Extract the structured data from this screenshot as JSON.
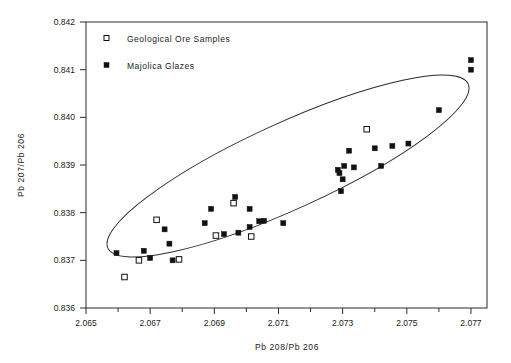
{
  "chart_data": {
    "type": "scatter",
    "title": "",
    "xlabel": "Pb 208/Pb 206",
    "ylabel": "Pb 207/Pb 206",
    "xlim": [
      2.065,
      2.0775
    ],
    "ylim": [
      0.836,
      0.842
    ],
    "grid": false,
    "legend_position": "top-left-inside",
    "x_ticks_major": [
      "2.065",
      "2.067",
      "2.069",
      "2.071",
      "2.073",
      "2.075",
      "2.077"
    ],
    "x_tick_values_major": [
      2.065,
      2.067,
      2.069,
      2.071,
      2.073,
      2.075,
      2.077
    ],
    "x_tick_values_minor": [
      2.066,
      2.068,
      2.07,
      2.072,
      2.074,
      2.076
    ],
    "y_ticks_major": [
      "0.836",
      "0.837",
      "0.838",
      "0.839",
      "0.840",
      "0.841",
      "0.842"
    ],
    "y_tick_values_major": [
      0.836,
      0.837,
      0.838,
      0.839,
      0.84,
      0.841,
      0.842
    ],
    "series": [
      {
        "name": "Geological Ore Samples",
        "marker": "open-square",
        "color": "#ffffff",
        "edge_color": "#111111",
        "points": [
          {
            "x": 2.06665,
            "y": 0.837
          },
          {
            "x": 2.0679,
            "y": 0.83702
          },
          {
            "x": 2.0662,
            "y": 0.83665
          },
          {
            "x": 2.0672,
            "y": 0.83785
          },
          {
            "x": 2.06905,
            "y": 0.83752
          },
          {
            "x": 2.0696,
            "y": 0.8382
          },
          {
            "x": 2.07015,
            "y": 0.8375
          },
          {
            "x": 2.07375,
            "y": 0.83975
          }
        ]
      },
      {
        "name": "Majolica Glazes",
        "marker": "filled-square",
        "color": "#111111",
        "edge_color": "#111111",
        "points": [
          {
            "x": 2.06595,
            "y": 0.83715
          },
          {
            "x": 2.0668,
            "y": 0.8372
          },
          {
            "x": 2.067,
            "y": 0.83705
          },
          {
            "x": 2.0676,
            "y": 0.83735
          },
          {
            "x": 2.0677,
            "y": 0.837
          },
          {
            "x": 2.06745,
            "y": 0.83765
          },
          {
            "x": 2.0687,
            "y": 0.83778
          },
          {
            "x": 2.0693,
            "y": 0.83755
          },
          {
            "x": 2.06975,
            "y": 0.83758
          },
          {
            "x": 2.0701,
            "y": 0.8377
          },
          {
            "x": 2.0704,
            "y": 0.83782
          },
          {
            "x": 2.07055,
            "y": 0.83783
          },
          {
            "x": 2.0689,
            "y": 0.83808
          },
          {
            "x": 2.06965,
            "y": 0.83833
          },
          {
            "x": 2.0701,
            "y": 0.83808
          },
          {
            "x": 2.07115,
            "y": 0.83778
          },
          {
            "x": 2.07295,
            "y": 0.83845
          },
          {
            "x": 2.073,
            "y": 0.8387
          },
          {
            "x": 2.0729,
            "y": 0.83883
          },
          {
            "x": 2.07285,
            "y": 0.8389
          },
          {
            "x": 2.07305,
            "y": 0.83898
          },
          {
            "x": 2.07335,
            "y": 0.83895
          },
          {
            "x": 2.0742,
            "y": 0.83898
          },
          {
            "x": 2.0732,
            "y": 0.8393
          },
          {
            "x": 2.074,
            "y": 0.83935
          },
          {
            "x": 2.07455,
            "y": 0.8394
          },
          {
            "x": 2.07505,
            "y": 0.83945
          },
          {
            "x": 2.076,
            "y": 0.84015
          },
          {
            "x": 2.077,
            "y": 0.8412
          },
          {
            "x": 2.077,
            "y": 0.841
          }
        ]
      }
    ],
    "annotations": [
      {
        "type": "ellipse",
        "description": "tilted confidence ellipse enclosing the data field",
        "center_x": 2.0714,
        "center_y": 0.839,
        "angle_deg": 23
      }
    ]
  },
  "legend": {
    "entries": [
      {
        "label": "Geological Ore Samples",
        "marker": "open-square"
      },
      {
        "label": "Majolica Glazes",
        "marker": "filled-square"
      }
    ]
  },
  "axes": {
    "x_title": "Pb 208/Pb 206",
    "y_title": "Pb 207/Pb 206"
  }
}
